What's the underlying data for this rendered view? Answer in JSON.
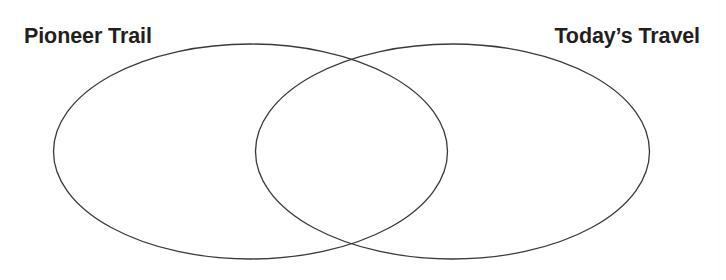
{
  "page": {
    "width": 726,
    "height": 280,
    "background_color": "#ffffff"
  },
  "diagram": {
    "type": "venn",
    "set_count": 2,
    "stroke_color": "#3a3a3a",
    "stroke_width": 1.3,
    "fill": "none",
    "left_circle": {
      "label": "Pioneer Trail",
      "cx": 250.5,
      "cy": 151.5,
      "rx": 197,
      "ry": 107.5
    },
    "right_circle": {
      "label": "Today’s Travel",
      "cx": 452.5,
      "cy": 151.5,
      "rx": 197,
      "ry": 107.5
    },
    "intersection": {
      "label": "",
      "top_crossing_x": 351,
      "top_crossing_y": 58,
      "bottom_crossing_x": 351,
      "bottom_crossing_y": 245
    }
  },
  "labels": {
    "left": "Pioneer Trail",
    "right": "Today’s Travel",
    "color": "#231f20"
  }
}
